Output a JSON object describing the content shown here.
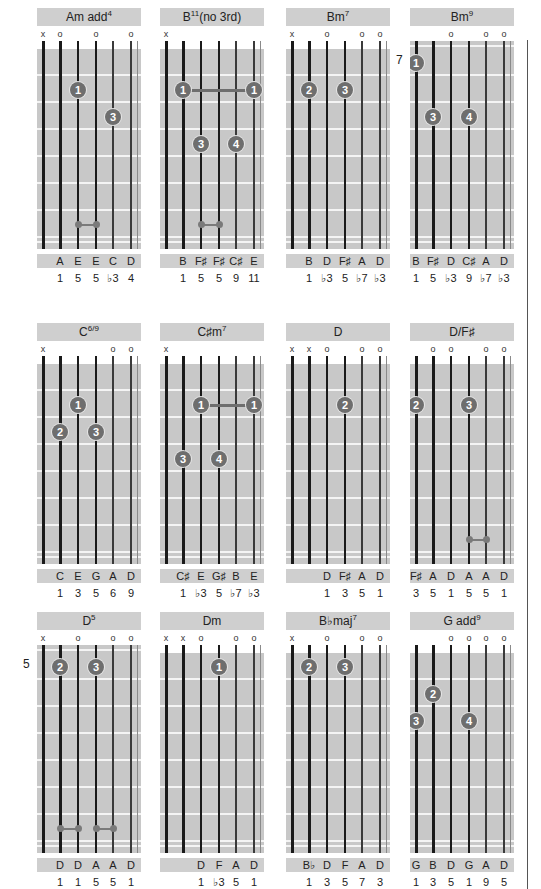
{
  "page": {
    "divider": true,
    "colors": {
      "title_bar": "#cfcfcf",
      "fretboard": "#c8c8c8",
      "nut": "#ffffff",
      "fret_line": "#f4f4f4",
      "string": "#1a1a1a",
      "finger_dot": "#6e6e6e",
      "finger_text": "#ffffff"
    }
  },
  "chart_data": {
    "type": "table",
    "strings": 6,
    "columns": [
      "name",
      "string_marks",
      "start_fret",
      "fingers",
      "barres",
      "harmonics",
      "notes",
      "intervals"
    ],
    "chords": [
      {
        "name": "Am add",
        "sup": "4",
        "suffix": "",
        "marks": [
          "x",
          "o",
          "",
          "o",
          "",
          "o"
        ],
        "start_fret": "",
        "fingers": [
          {
            "string": 3,
            "fret": 2,
            "label": "1"
          },
          {
            "string": 5,
            "fret": 3,
            "label": "3"
          }
        ],
        "barres": [],
        "harmonics": [
          {
            "from": 3,
            "to": 4,
            "fret": 7
          }
        ],
        "notes": [
          "",
          "A",
          "E",
          "E",
          "C",
          "D"
        ],
        "intervals": [
          "",
          "1",
          "5",
          "5",
          "♭3",
          "4"
        ]
      },
      {
        "name": "B",
        "sup": "11",
        "suffix": "(no 3rd)",
        "marks": [
          "x",
          "",
          "",
          "",
          "",
          ""
        ],
        "start_fret": "",
        "fingers": [
          {
            "string": 2,
            "fret": 2,
            "label": "1"
          },
          {
            "string": 6,
            "fret": 2,
            "label": "1"
          },
          {
            "string": 3,
            "fret": 4,
            "label": "3"
          },
          {
            "string": 5,
            "fret": 4,
            "label": "4"
          }
        ],
        "barres": [
          {
            "from": 2,
            "to": 6,
            "fret": 2
          }
        ],
        "harmonics": [
          {
            "from": 3,
            "to": 4,
            "fret": 7
          }
        ],
        "notes": [
          "",
          "B",
          "F♯",
          "F♯",
          "C♯",
          "E"
        ],
        "intervals": [
          "",
          "1",
          "5",
          "5",
          "9",
          "11"
        ]
      },
      {
        "name": "Bm",
        "sup": "7",
        "suffix": "",
        "marks": [
          "x",
          "",
          "o",
          "",
          "o",
          "o"
        ],
        "start_fret": "",
        "fingers": [
          {
            "string": 2,
            "fret": 2,
            "label": "2"
          },
          {
            "string": 4,
            "fret": 2,
            "label": "3"
          }
        ],
        "barres": [],
        "harmonics": [],
        "notes": [
          "",
          "B",
          "D",
          "F♯",
          "A",
          "D"
        ],
        "intervals": [
          "",
          "1",
          "♭3",
          "5",
          "♭7",
          "♭3"
        ]
      },
      {
        "name": "Bm",
        "sup": "9",
        "suffix": "",
        "marks": [
          "",
          "",
          "o",
          "",
          "o",
          "o"
        ],
        "start_fret": "7",
        "fingers": [
          {
            "string": 1,
            "fret": 1,
            "label": "1"
          },
          {
            "string": 2,
            "fret": 3,
            "label": "3"
          },
          {
            "string": 4,
            "fret": 3,
            "label": "4"
          }
        ],
        "barres": [],
        "harmonics": [],
        "notes": [
          "B",
          "F♯",
          "D",
          "C♯",
          "A",
          "D"
        ],
        "intervals": [
          "1",
          "5",
          "♭3",
          "9",
          "♭7",
          "♭3"
        ]
      },
      {
        "name": "C",
        "sup": "6/9",
        "suffix": "",
        "marks": [
          "x",
          "",
          "",
          "",
          "o",
          "o"
        ],
        "start_fret": "",
        "fingers": [
          {
            "string": 3,
            "fret": 2,
            "label": "1"
          },
          {
            "string": 2,
            "fret": 3,
            "label": "2"
          },
          {
            "string": 4,
            "fret": 3,
            "label": "3"
          }
        ],
        "barres": [],
        "harmonics": [],
        "notes": [
          "",
          "C",
          "E",
          "G",
          "A",
          "D"
        ],
        "intervals": [
          "",
          "1",
          "3",
          "5",
          "6",
          "9"
        ]
      },
      {
        "name": "C♯m",
        "sup": "7",
        "suffix": "",
        "marks": [
          "x",
          "",
          "",
          "",
          "",
          ""
        ],
        "start_fret": "",
        "fingers": [
          {
            "string": 3,
            "fret": 2,
            "label": "1"
          },
          {
            "string": 6,
            "fret": 2,
            "label": "1"
          },
          {
            "string": 2,
            "fret": 4,
            "label": "3"
          },
          {
            "string": 4,
            "fret": 4,
            "label": "4"
          }
        ],
        "barres": [
          {
            "from": 3,
            "to": 6,
            "fret": 2
          }
        ],
        "harmonics": [],
        "notes": [
          "",
          "C♯",
          "E",
          "G♯",
          "B",
          "E"
        ],
        "intervals": [
          "",
          "1",
          "♭3",
          "5",
          "♭7",
          "♭3"
        ]
      },
      {
        "name": "D",
        "sup": "",
        "suffix": "",
        "marks": [
          "x",
          "x",
          "o",
          "",
          "o",
          "o"
        ],
        "start_fret": "",
        "fingers": [
          {
            "string": 4,
            "fret": 2,
            "label": "2"
          }
        ],
        "barres": [],
        "harmonics": [],
        "notes": [
          "",
          "",
          "D",
          "F♯",
          "A",
          "D"
        ],
        "intervals": [
          "",
          "",
          "1",
          "3",
          "5",
          "1"
        ]
      },
      {
        "name": "D/F♯",
        "sup": "",
        "suffix": "",
        "marks": [
          "",
          "o",
          "o",
          "",
          "o",
          "o"
        ],
        "start_fret": "",
        "fingers": [
          {
            "string": 1,
            "fret": 2,
            "label": "2"
          },
          {
            "string": 4,
            "fret": 2,
            "label": "3"
          }
        ],
        "barres": [],
        "harmonics": [
          {
            "from": 4,
            "to": 5,
            "fret": 7
          }
        ],
        "notes": [
          "F♯",
          "A",
          "D",
          "A",
          "A",
          "D"
        ],
        "intervals": [
          "3",
          "5",
          "1",
          "5",
          "5",
          "1"
        ]
      },
      {
        "name": "D",
        "sup": "5",
        "suffix": "",
        "marks": [
          "x",
          "",
          "o",
          "",
          "o",
          "o"
        ],
        "start_fret": "5",
        "fingers": [
          {
            "string": 2,
            "fret": 1,
            "label": "2"
          },
          {
            "string": 4,
            "fret": 1,
            "label": "3"
          }
        ],
        "barres": [],
        "harmonics": [
          {
            "from": 2,
            "to": 3,
            "fret": 7
          },
          {
            "from": 4,
            "to": 5,
            "fret": 7
          }
        ],
        "notes": [
          "",
          "D",
          "D",
          "A",
          "A",
          "D"
        ],
        "intervals": [
          "",
          "1",
          "1",
          "5",
          "5",
          "1"
        ]
      },
      {
        "name": "Dm",
        "sup": "",
        "suffix": "",
        "marks": [
          "x",
          "x",
          "o",
          "",
          "o",
          "o"
        ],
        "start_fret": "",
        "fingers": [
          {
            "string": 4,
            "fret": 1,
            "label": "1"
          }
        ],
        "barres": [],
        "harmonics": [],
        "notes": [
          "",
          "",
          "D",
          "F",
          "A",
          "D"
        ],
        "intervals": [
          "",
          "",
          "1",
          "♭3",
          "5",
          "1"
        ]
      },
      {
        "name": "B♭maj",
        "sup": "7",
        "suffix": "",
        "marks": [
          "x",
          "",
          "o",
          "",
          "o",
          "o"
        ],
        "start_fret": "",
        "fingers": [
          {
            "string": 2,
            "fret": 1,
            "label": "2"
          },
          {
            "string": 4,
            "fret": 1,
            "label": "3"
          }
        ],
        "barres": [],
        "harmonics": [],
        "notes": [
          "",
          "B♭",
          "D",
          "F",
          "A",
          "D"
        ],
        "intervals": [
          "",
          "1",
          "3",
          "5",
          "7",
          "3"
        ]
      },
      {
        "name": "G add",
        "sup": "9",
        "suffix": "",
        "marks": [
          "",
          "",
          "o",
          "o",
          "o",
          "o"
        ],
        "start_fret": "",
        "fingers": [
          {
            "string": 2,
            "fret": 2,
            "label": "2"
          },
          {
            "string": 1,
            "fret": 3,
            "label": "3"
          },
          {
            "string": 4,
            "fret": 3,
            "label": "4"
          }
        ],
        "barres": [],
        "harmonics": [],
        "notes": [
          "G",
          "B",
          "D",
          "G",
          "A",
          "D"
        ],
        "intervals": [
          "1",
          "3",
          "5",
          "1",
          "9",
          "5"
        ]
      }
    ]
  }
}
